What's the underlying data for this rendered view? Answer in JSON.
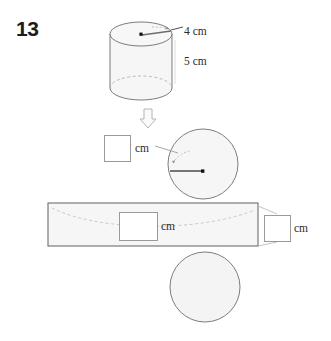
{
  "question": {
    "number": "13",
    "type": "cylinder-net-labeling"
  },
  "labels": {
    "radius_top": "4 cm",
    "height_side": "5 cm",
    "unit_left": "cm",
    "unit_middle": "cm",
    "unit_right": "cm"
  },
  "answer_boxes": {
    "left": "",
    "middle": "",
    "right": ""
  },
  "icons": {
    "down_arrow": "down-block-arrow-icon"
  },
  "colors": {
    "shape_fill": "#f6f6f6",
    "shape_stroke": "#6e6e6e",
    "dashed_stroke": "#a8a8a8",
    "arrow_dark": "#444444",
    "text": "#2b2b2b",
    "qnum": "#1c1c1c",
    "box_border": "#9a9a9a",
    "background": "#ffffff"
  },
  "shapes": {
    "cylinder": {
      "name": "cylinder-3d",
      "radius_label": "4 cm",
      "height_label": "5 cm",
      "cx": 141,
      "top_cy": 34,
      "bottom_cy": 88,
      "rx": 31,
      "ry": 12
    },
    "net_circle_top": {
      "name": "net-top-circle",
      "cx": 203,
      "cy": 164,
      "r": 35
    },
    "net_rectangle": {
      "name": "net-rectangle",
      "x": 48,
      "y": 203,
      "width": 210,
      "height": 43
    },
    "net_circle_bottom": {
      "name": "net-bottom-circle",
      "cx": 205,
      "cy": 287,
      "r": 35
    }
  }
}
